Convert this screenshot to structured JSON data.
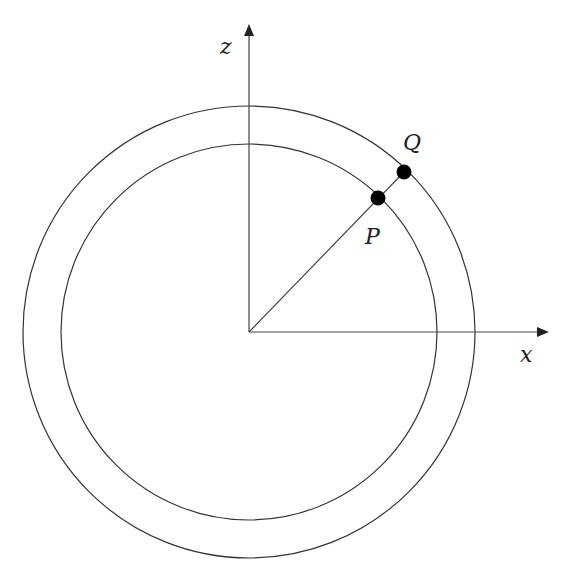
{
  "diagram": {
    "type": "concentric-circles-with-axes",
    "axes": {
      "horizontal_label": "x",
      "vertical_label": "z"
    },
    "center": {
      "x": 249,
      "y": 332
    },
    "circles": [
      {
        "name": "inner-circle",
        "radius": 188
      },
      {
        "name": "outer-circle",
        "radius": 226
      }
    ],
    "points": [
      {
        "label": "P",
        "on": "inner-circle"
      },
      {
        "label": "Q",
        "on": "outer-circle"
      }
    ],
    "colors": {
      "stroke": "#333333",
      "point": "#000000"
    }
  }
}
